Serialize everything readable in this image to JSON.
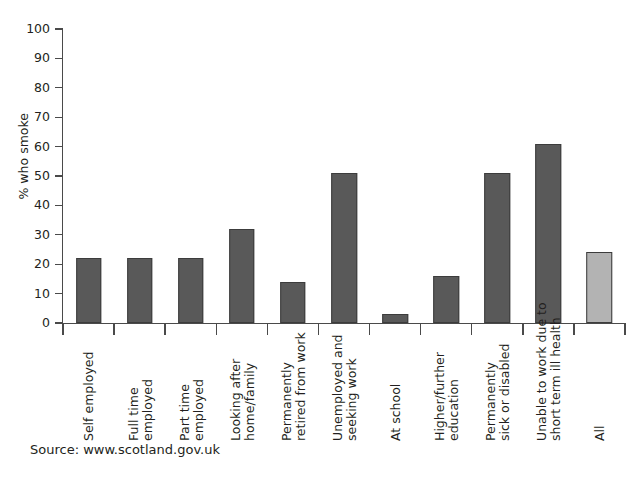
{
  "figure": {
    "bleed_through_text": "",
    "source_note": "Source: www.scotland.gov.uk"
  },
  "chart_data": {
    "type": "bar",
    "title": "",
    "xlabel": "",
    "ylabel": "% who smoke",
    "ylim": [
      0,
      100
    ],
    "ytick_step": 10,
    "ytick_labels": [
      "100",
      "90",
      "80",
      "70",
      "60",
      "50",
      "40",
      "30",
      "20",
      "10",
      "0"
    ],
    "grid": false,
    "legend": "none",
    "colors": {
      "bar_dark": "#595959",
      "bar_light": "#b3b3b3",
      "bar_border": "#3c3c3c",
      "axis": "#4a4a4a",
      "text": "#231f20"
    },
    "categories": [
      "Self employed",
      "Full time\nemployed",
      "Part time\nemployed",
      "Looking after\nhome/family",
      "Permanently\nretired from work",
      "Unemployed and\nseeking work",
      "At school",
      "Higher/further\neducation",
      "Permanently\nsick or disabled",
      "Unable to work due to\nshort term ill health",
      "All"
    ],
    "values": [
      22,
      22,
      22,
      32,
      14,
      51,
      3,
      16,
      51,
      61,
      24
    ],
    "highlight_index": 10,
    "series": [
      {
        "name": "% who smoke",
        "values": [
          22,
          22,
          22,
          32,
          14,
          51,
          3,
          16,
          51,
          61,
          24
        ]
      }
    ]
  }
}
